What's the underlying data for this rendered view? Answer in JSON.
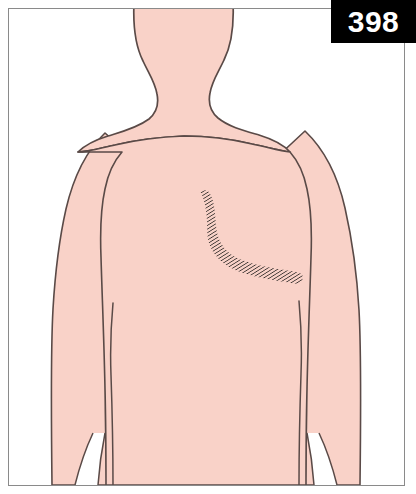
{
  "figure": {
    "number_label": "398",
    "caption": "",
    "view": "posterior upper back and shoulders"
  },
  "colors": {
    "skin_fill": "#f9d2c8",
    "skin_fill_shade": "#f6c9bf",
    "outline": "#5a4a47",
    "frame_border": "#8a8a8a",
    "background": "#ffffff",
    "badge_background": "#000000",
    "badge_text": "#ffffff",
    "lesion_hatch": "#3a3330"
  },
  "body_figure": {
    "label": "human upper body, posterior view",
    "parts": [
      {
        "name": "head-base",
        "label": "head base"
      },
      {
        "name": "neck",
        "label": "neck"
      },
      {
        "name": "left-shoulder",
        "label": "left shoulder"
      },
      {
        "name": "right-shoulder",
        "label": "right shoulder"
      },
      {
        "name": "upper-back",
        "label": "upper back / torso"
      },
      {
        "name": "left-arm",
        "label": "left upper arm"
      },
      {
        "name": "right-arm",
        "label": "right upper arm"
      },
      {
        "name": "left-axilla-crease",
        "label": "left axillary crease"
      },
      {
        "name": "right-axilla-crease",
        "label": "right axillary crease"
      }
    ]
  },
  "lesion": {
    "name": "shaded-lesion-band",
    "label": "hatched dermatomal band on right upper back",
    "description": "hook-shaped hatched band beginning as a narrow point near the midline of the upper back, widening into a blade, curving inferolaterally and tapering toward the right axilla",
    "hatch_line_count": 78,
    "path_points": [
      {
        "x": 208,
        "y": 199
      },
      {
        "x": 213,
        "y": 215
      },
      {
        "x": 214,
        "y": 232
      },
      {
        "x": 219,
        "y": 248
      },
      {
        "x": 229,
        "y": 261
      },
      {
        "x": 244,
        "y": 270
      },
      {
        "x": 262,
        "y": 275
      },
      {
        "x": 281,
        "y": 279
      },
      {
        "x": 299,
        "y": 283
      },
      {
        "x": 310,
        "y": 286
      }
    ],
    "band_widths": [
      3,
      13,
      19,
      17,
      13,
      12,
      12,
      11,
      8,
      3
    ]
  }
}
